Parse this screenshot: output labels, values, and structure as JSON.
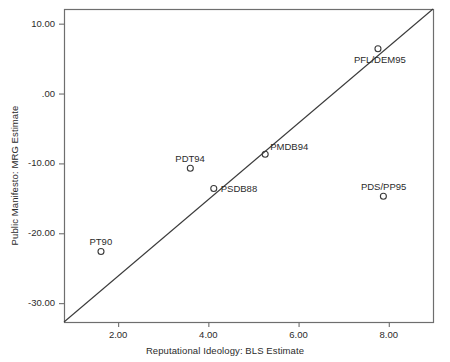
{
  "chart_data": {
    "type": "scatter",
    "title": "",
    "xlabel": "Reputational Ideology: BLS Estimate",
    "ylabel": "Public Manifesto: MRG Estimate",
    "xlim": [
      0.8,
      8.98
    ],
    "ylim": [
      -32.7,
      12.1
    ],
    "grid": false,
    "legend": null,
    "xticks": [
      2.0,
      4.0,
      6.0,
      8.0
    ],
    "xtick_labels": [
      "2.00",
      "4.00",
      "6.00",
      "8.00"
    ],
    "yticks": [
      10.0,
      0.0,
      -10.0,
      -20.0,
      -30.0
    ],
    "ytick_labels": [
      "10.00",
      ".00",
      "-10.00",
      "-20.00",
      "-30.00"
    ],
    "reference_line": {
      "name": "identity-diagonal",
      "description": "45-degree line from lower-left corner to upper-right corner",
      "from": [
        0.8,
        -32.7
      ],
      "to": [
        8.98,
        12.1
      ]
    },
    "marker": {
      "shape": "open-circle",
      "radius_px": 3,
      "color": "#3a3a3a",
      "fill": "none"
    },
    "points": [
      {
        "label": "PT90",
        "x": 1.62,
        "y": -22.6,
        "label_pos": "above"
      },
      {
        "label": "PDT94",
        "x": 3.6,
        "y": -10.7,
        "label_pos": "above"
      },
      {
        "label": "PSDB88",
        "x": 4.12,
        "y": -13.6,
        "label_pos": "right"
      },
      {
        "label": "PMDB94",
        "x": 5.26,
        "y": -8.7,
        "label_pos": "above-right"
      },
      {
        "label": "PFL/DEM95",
        "x": 7.76,
        "y": 6.4,
        "label_pos": "below"
      },
      {
        "label": "PDS/PP95",
        "x": 7.88,
        "y": -14.7,
        "label_pos": "above"
      }
    ]
  },
  "colors": {
    "frame": "#6e6e6e",
    "line": "#3a3a3a",
    "text": "#2b2b2b",
    "background": "#ffffff"
  }
}
